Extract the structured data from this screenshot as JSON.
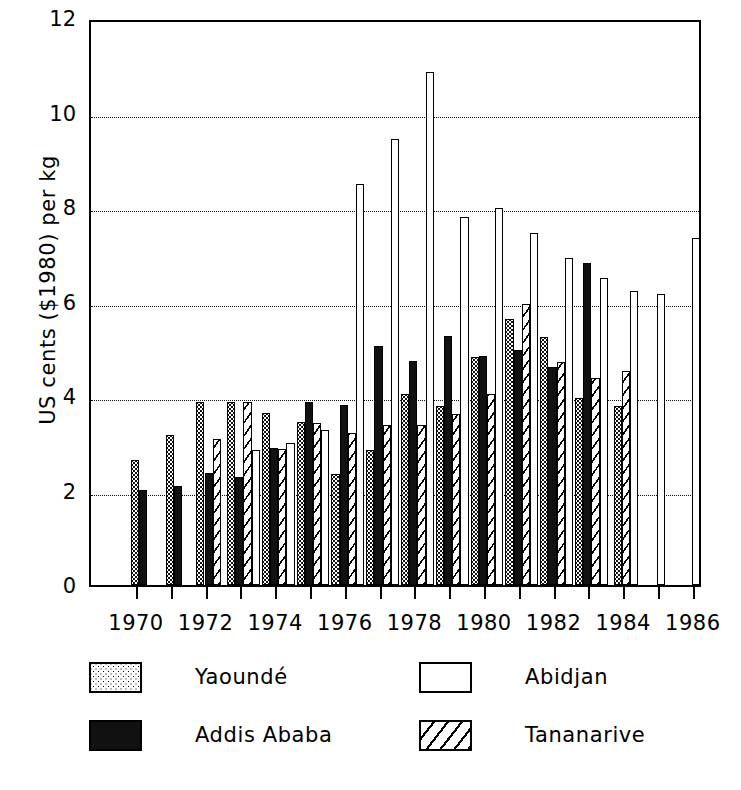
{
  "chart_data": {
    "type": "bar",
    "title": "",
    "subtitle": "",
    "xlabel": "",
    "ylabel": "US cents ($1980) per kg",
    "ylim": [
      0,
      12
    ],
    "ytick_labels": [
      "0",
      "2",
      "4",
      "6",
      "8",
      "10",
      "12"
    ],
    "ytick_values": [
      0,
      2,
      4,
      6,
      8,
      10,
      12
    ],
    "grid": "horizontal-dotted",
    "legend_position": "below-plot",
    "x": [
      1970,
      1971,
      1972,
      1973,
      1974,
      1975,
      1976,
      1977,
      1978,
      1979,
      1980,
      1981,
      1982,
      1983,
      1984,
      1985,
      1986
    ],
    "xtick_labels": [
      "1970",
      "1972",
      "1974",
      "1976",
      "1978",
      "1980",
      "1982",
      "1984",
      "1986"
    ],
    "xtick_values": [
      1970,
      1972,
      1974,
      1976,
      1978,
      1980,
      1982,
      1984,
      1986
    ],
    "series": [
      {
        "name": "Yaoundé",
        "pattern": "dotted",
        "values": [
          2.65,
          3.18,
          3.88,
          3.88,
          3.65,
          3.45,
          2.35,
          2.85,
          4.05,
          3.78,
          4.83,
          5.62,
          5.25,
          3.95,
          3.78,
          null,
          null
        ]
      },
      {
        "name": "Addis Ababa",
        "pattern": "solid",
        "values": [
          2.02,
          2.1,
          2.38,
          2.28,
          2.9,
          3.88,
          3.8,
          5.05,
          4.75,
          5.28,
          4.85,
          4.98,
          4.62,
          6.82,
          null,
          null,
          null
        ]
      },
      {
        "name": "Abidjan",
        "pattern": "empty",
        "values": [
          null,
          null,
          null,
          2.85,
          3.0,
          3.28,
          8.48,
          9.45,
          10.85,
          7.78,
          7.98,
          7.45,
          6.92,
          6.5,
          6.22,
          6.15,
          7.35
        ]
      },
      {
        "name": "Tananarive",
        "pattern": "hatch",
        "values": [
          null,
          null,
          3.1,
          3.88,
          2.88,
          3.42,
          3.22,
          3.38,
          3.38,
          3.62,
          4.05,
          5.95,
          4.72,
          4.38,
          4.52,
          null,
          null
        ]
      }
    ]
  },
  "legend": {
    "items": [
      {
        "label": "Yaoundé",
        "pattern": "dotted"
      },
      {
        "label": "Abidjan",
        "pattern": "empty"
      },
      {
        "label": "Addis Ababa",
        "pattern": "solid"
      },
      {
        "label": "Tananarive",
        "pattern": "hatch"
      }
    ]
  }
}
